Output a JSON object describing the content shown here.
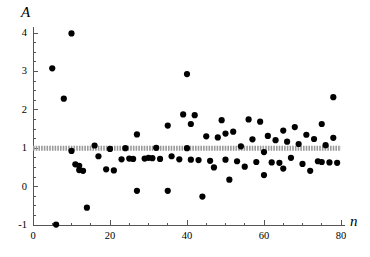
{
  "chart_data": {
    "type": "scatter",
    "title": "",
    "subtitle": "",
    "xlabel": "n",
    "ylabel": "A",
    "xlim": [
      0,
      80
    ],
    "ylim": [
      -1,
      4
    ],
    "grid": false,
    "legend": null,
    "x_ticks": [
      0,
      20,
      40,
      60,
      80
    ],
    "x_tick_labels": [
      "0",
      "20",
      "40",
      "60",
      "80"
    ],
    "x_minor_tick_step": 5,
    "y_ticks": [
      -1,
      0,
      1,
      2,
      3,
      4
    ],
    "y_tick_labels": [
      "-1",
      "0",
      "1",
      "2",
      "3",
      "4"
    ],
    "y_minor_tick_step": 0.25,
    "marker_color": "#000000",
    "marker_size": 3.1,
    "reference_line": {
      "name": "mean-reference-line",
      "y": 1,
      "color": "#9a9a9a",
      "style": "dotted-thick",
      "thickness": 5,
      "x_start": 0,
      "x_end": 80
    },
    "axis_color": "#555555",
    "points": [
      {
        "n": 5,
        "A": 3.08
      },
      {
        "n": 6,
        "A": -0.99
      },
      {
        "n": 8,
        "A": 2.29
      },
      {
        "n": 10,
        "A": 3.99
      },
      {
        "n": 10,
        "A": 0.93
      },
      {
        "n": 11,
        "A": 0.58
      },
      {
        "n": 12,
        "A": 0.54
      },
      {
        "n": 12,
        "A": 0.43
      },
      {
        "n": 13,
        "A": 0.41
      },
      {
        "n": 14,
        "A": -0.55
      },
      {
        "n": 16,
        "A": 1.07
      },
      {
        "n": 17,
        "A": 0.79
      },
      {
        "n": 19,
        "A": 0.45
      },
      {
        "n": 20,
        "A": 0.98
      },
      {
        "n": 21,
        "A": 0.42
      },
      {
        "n": 23,
        "A": 0.71
      },
      {
        "n": 24,
        "A": 1.0
      },
      {
        "n": 25,
        "A": 0.73
      },
      {
        "n": 26,
        "A": 0.72
      },
      {
        "n": 27,
        "A": 1.36
      },
      {
        "n": 27,
        "A": -0.11
      },
      {
        "n": 29,
        "A": 0.73
      },
      {
        "n": 30,
        "A": 0.75
      },
      {
        "n": 31,
        "A": 0.74
      },
      {
        "n": 32,
        "A": 1.01
      },
      {
        "n": 33,
        "A": 0.72
      },
      {
        "n": 35,
        "A": 1.59
      },
      {
        "n": 35,
        "A": -0.11
      },
      {
        "n": 36,
        "A": 0.79
      },
      {
        "n": 38,
        "A": 0.71
      },
      {
        "n": 39,
        "A": 1.88
      },
      {
        "n": 40,
        "A": 2.93
      },
      {
        "n": 40,
        "A": 1.0
      },
      {
        "n": 41,
        "A": 1.63
      },
      {
        "n": 41,
        "A": 0.7
      },
      {
        "n": 42,
        "A": 1.86
      },
      {
        "n": 43,
        "A": 0.69
      },
      {
        "n": 44,
        "A": -0.26
      },
      {
        "n": 45,
        "A": 1.31
      },
      {
        "n": 46,
        "A": 0.67
      },
      {
        "n": 47,
        "A": 0.5
      },
      {
        "n": 48,
        "A": 1.28
      },
      {
        "n": 49,
        "A": 1.73
      },
      {
        "n": 50,
        "A": 1.38
      },
      {
        "n": 50,
        "A": 0.7
      },
      {
        "n": 51,
        "A": 0.18
      },
      {
        "n": 52,
        "A": 1.43
      },
      {
        "n": 53,
        "A": 0.66
      },
      {
        "n": 54,
        "A": 1.05
      },
      {
        "n": 55,
        "A": 0.52
      },
      {
        "n": 56,
        "A": 1.75
      },
      {
        "n": 57,
        "A": 1.23
      },
      {
        "n": 58,
        "A": 0.64
      },
      {
        "n": 59,
        "A": 1.69
      },
      {
        "n": 60,
        "A": 0.9
      },
      {
        "n": 60,
        "A": 0.3
      },
      {
        "n": 61,
        "A": 1.32
      },
      {
        "n": 62,
        "A": 0.63
      },
      {
        "n": 63,
        "A": 1.21
      },
      {
        "n": 64,
        "A": 0.62
      },
      {
        "n": 65,
        "A": 1.46
      },
      {
        "n": 65,
        "A": 0.47
      },
      {
        "n": 66,
        "A": 1.17
      },
      {
        "n": 67,
        "A": 0.75
      },
      {
        "n": 68,
        "A": 1.55
      },
      {
        "n": 69,
        "A": 1.11
      },
      {
        "n": 70,
        "A": 0.59
      },
      {
        "n": 71,
        "A": 1.35
      },
      {
        "n": 72,
        "A": 0.41
      },
      {
        "n": 73,
        "A": 1.24
      },
      {
        "n": 74,
        "A": 0.66
      },
      {
        "n": 75,
        "A": 1.63
      },
      {
        "n": 75,
        "A": 0.64
      },
      {
        "n": 76,
        "A": 1.08
      },
      {
        "n": 77,
        "A": 0.63
      },
      {
        "n": 78,
        "A": 2.33
      },
      {
        "n": 78,
        "A": 1.27
      },
      {
        "n": 79,
        "A": 0.62
      }
    ]
  }
}
